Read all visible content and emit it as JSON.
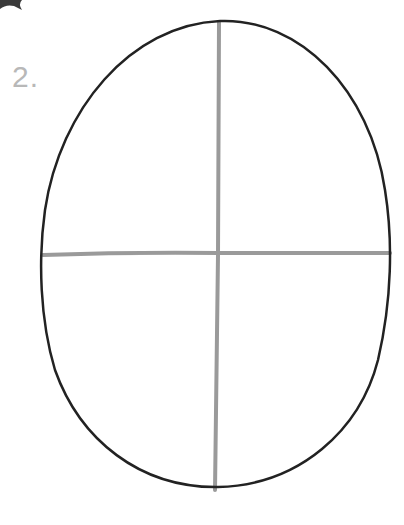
{
  "step": {
    "number_label": "2."
  },
  "drawing": {
    "subject": "oval head shape with vertical and horizontal guidelines",
    "outline_color": "#222222",
    "guideline_color": "#9a9a9a",
    "step_number_color": "#b8b8b8",
    "corner_fragment_color": "#3a3a3a"
  }
}
